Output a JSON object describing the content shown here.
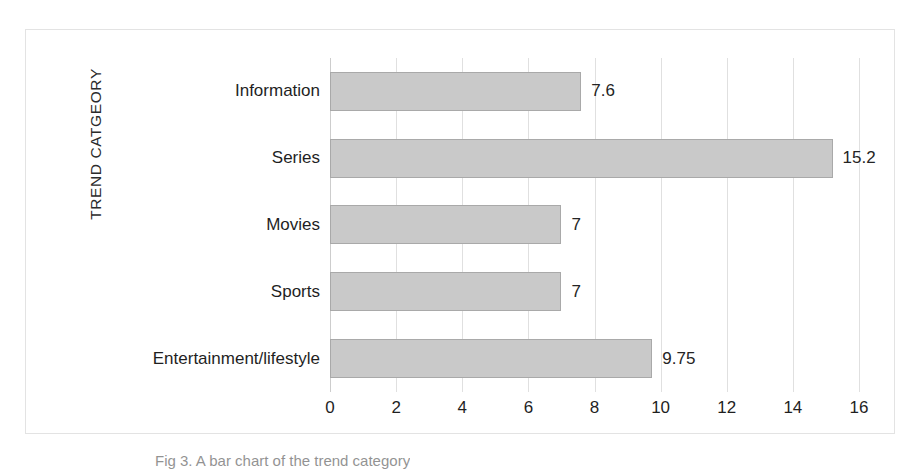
{
  "chart_data": {
    "type": "bar",
    "orientation": "horizontal",
    "title": "",
    "subtitle": "",
    "xlabel": "",
    "ylabel": "TREND CATGEORY",
    "categories": [
      "Information",
      "Series",
      "Movies",
      "Sports",
      "Entertainment/lifestyle"
    ],
    "values": [
      7.6,
      15.2,
      7,
      7,
      9.75
    ],
    "value_labels": [
      "7.6",
      "15.2",
      "7",
      "7",
      "9.75"
    ],
    "xlim": [
      0,
      16
    ],
    "xticks": [
      0,
      2,
      4,
      6,
      8,
      10,
      12,
      14,
      16
    ],
    "xtick_labels": [
      "0",
      "2",
      "4",
      "6",
      "8",
      "10",
      "12",
      "14",
      "16"
    ],
    "grid": "vertical",
    "legend": "none",
    "bar_color": "#c9c9c9",
    "bar_border_color": "#a9a9a9",
    "gridline_color": "#e0e0e0",
    "frame_color": "#e3e3e3",
    "text_color": "#1f1f1f"
  },
  "axis": {
    "y_title": "TREND CATGEORY"
  },
  "caption": {
    "text": "Fig 3. A bar chart of the trend category"
  }
}
